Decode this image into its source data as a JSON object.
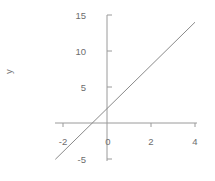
{
  "chart_data": {
    "type": "line",
    "title": "",
    "subtitle": "",
    "xlabel": "",
    "ylabel": "y",
    "grid": false,
    "legend": false,
    "line_color": "#8a8a8a",
    "axis_color": "#9a9a9a",
    "text_color": "#6d6d6d",
    "background": "#ffffff",
    "equation": "y = 3x + 2",
    "slope": 3,
    "intercept": 2,
    "x_intercept": -0.6667,
    "xlim": [
      -2.6,
      4.4
    ],
    "ylim": [
      -6.2,
      15.6
    ],
    "x_ticks": [
      -2,
      0,
      2,
      4
    ],
    "x_tick_labels": [
      "-2",
      "0",
      "2",
      "4"
    ],
    "y_ticks": [
      -5,
      5,
      10,
      15
    ],
    "y_tick_labels": [
      "-5",
      "5",
      "10",
      "15"
    ],
    "series": [
      {
        "name": "y = 3x + 2",
        "x": [
          -2.35,
          4.0
        ],
        "y": [
          -5.05,
          14.0
        ],
        "points": [
          {
            "x": -2.35,
            "y": -5.05
          },
          {
            "x": -0.667,
            "y": 0
          },
          {
            "x": 0,
            "y": 2
          },
          {
            "x": 1,
            "y": 5
          },
          {
            "x": 2,
            "y": 8
          },
          {
            "x": 3,
            "y": 11
          },
          {
            "x": 4,
            "y": 14
          }
        ]
      }
    ]
  }
}
